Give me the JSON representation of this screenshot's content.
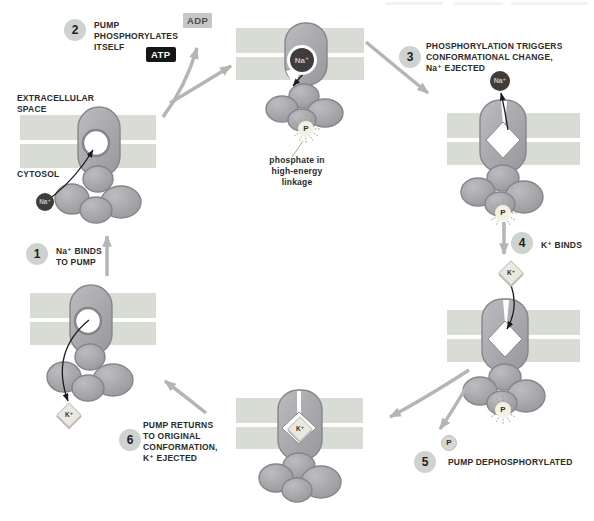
{
  "labels": {
    "extracellular_space": "EXTRACELLULAR SPACE",
    "cytosol": "CYTOSOL",
    "phosphate_note": "phosphate in high-energy linkage"
  },
  "molecules": {
    "atp": "ATP",
    "adp": "ADP",
    "sodium": "Na⁺",
    "potassium": "K⁺",
    "phosphate": "P"
  },
  "steps": [
    {
      "num": "1",
      "text": "Na⁺ BINDS TO PUMP"
    },
    {
      "num": "2",
      "text": "PUMP PHOSPHORYLATES ITSELF"
    },
    {
      "num": "3",
      "text": "PHOSPHORYLATION TRIGGERS CONFORMATIONAL CHANGE, Na⁺ EJECTED"
    },
    {
      "num": "4",
      "text": "K⁺ BINDS"
    },
    {
      "num": "5",
      "text": "PUMP DEPHOSPHORYLATED"
    },
    {
      "num": "6",
      "text": "PUMP RETURNS TO ORIGINAL CONFORMATION, K⁺ EJECTED"
    }
  ],
  "colors": {
    "membrane": "#d8dcd4",
    "pump_body": "#a7a7ab",
    "pump_edge": "#86868a",
    "sodium_ball": "#403c3b",
    "potassium_diamond": "#eae8e0",
    "phosphate_starburst_fill": "#f3f1e3",
    "free_phosphate_fill": "#d6d6d2",
    "cycle_arrow_gray": "#b3b7b3",
    "ion_arrow_black": "#1c1c1c",
    "atp_bg": "#161616",
    "adp_bg": "#c6c6c6",
    "step_circle_bg": "#cfd3cf"
  }
}
